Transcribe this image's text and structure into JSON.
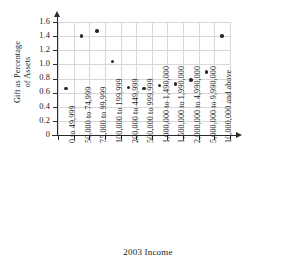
{
  "chart_data": {
    "type": "scatter",
    "title": "",
    "xlabel": "2003 Income",
    "ylabel_lines": [
      "Gift as Percentage",
      "of Assets"
    ],
    "ylabel": "Gift as Percentage of Assets",
    "ylim": [
      0,
      1.6
    ],
    "ytick_labels": [
      "1.6",
      "1.4",
      "1.2",
      "1.0",
      "0.8",
      "0.6",
      "0.4",
      "0.2",
      "0"
    ],
    "ytick_values": [
      1.6,
      1.4,
      1.2,
      1.0,
      0.8,
      0.6,
      0.4,
      0.2,
      0
    ],
    "grid": true,
    "legend": "none",
    "categories": [
      "0 to 49,999",
      "50,000 to 74,999",
      "75,000 to 99,999",
      "100,000 to 199,999",
      "200,000 to 449,999",
      "500,000 to 999,999",
      "1,000,000 to 1,490,000",
      "1,500,000 to 1,990,000",
      "2,000,000 to 4,990,000",
      "5,000,000 to 9,990,000",
      "10,000,000 and above"
    ],
    "values": [
      0.66,
      1.4,
      1.47,
      1.04,
      0.67,
      0.66,
      0.7,
      0.72,
      0.78,
      0.89,
      1.4
    ],
    "marker": "filled-circle",
    "marker_color": "#2b2b2b",
    "grid_color": "#d8d8d8",
    "axis_color": "#2b2b2b"
  }
}
